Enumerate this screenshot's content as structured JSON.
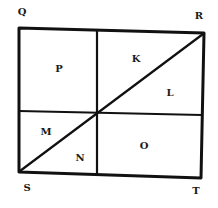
{
  "diagram": {
    "type": "geometric-figure",
    "corners": [
      {
        "label": "Q",
        "x": 22,
        "y": 15
      },
      {
        "label": "R",
        "x": 199,
        "y": 19
      },
      {
        "label": "S",
        "x": 27,
        "y": 191
      },
      {
        "label": "T",
        "x": 196,
        "y": 194
      }
    ],
    "regions": [
      {
        "label": "P",
        "x": 59,
        "y": 72
      },
      {
        "label": "K",
        "x": 136,
        "y": 62
      },
      {
        "label": "L",
        "x": 170,
        "y": 96
      },
      {
        "label": "M",
        "x": 46,
        "y": 135
      },
      {
        "label": "N",
        "x": 80,
        "y": 161
      },
      {
        "label": "O",
        "x": 144,
        "y": 149
      }
    ],
    "stroke_color": "#111111"
  }
}
